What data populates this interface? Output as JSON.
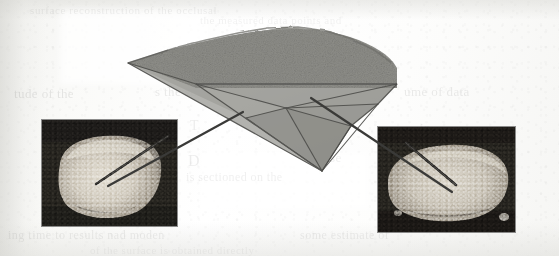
{
  "page": {
    "kind": "scanned-journal-figure",
    "width": 559,
    "height": 256,
    "background_color": "#fbfbfa",
    "paper_tint": "#f4f4f1"
  },
  "figure": {
    "name": "triangulated-3d-surface-with-photo-callouts",
    "mesh": {
      "label": "3d-surface-mesh",
      "fill_color": "#9d9d99",
      "edge_color": "#4c4c4a",
      "top_texture_color": "#8e8e8a",
      "apex_point": [
        320,
        171
      ],
      "left_tip_point": [
        128,
        63
      ],
      "facet_count": 14,
      "outline": [
        [
          128,
          63
        ],
        [
          168,
          50
        ],
        [
          230,
          36
        ],
        [
          286,
          27
        ],
        [
          330,
          31
        ],
        [
          368,
          45
        ],
        [
          393,
          62
        ],
        [
          397,
          84
        ],
        [
          378,
          104
        ],
        [
          351,
          126
        ],
        [
          322,
          171
        ],
        [
          246,
          118
        ],
        [
          196,
          84
        ]
      ],
      "edges": [
        [
          [
            128,
            63
          ],
          [
            322,
            171
          ]
        ],
        [
          [
            196,
            84
          ],
          [
            322,
            171
          ]
        ],
        [
          [
            246,
            118
          ],
          [
            322,
            171
          ]
        ],
        [
          [
            286,
            108
          ],
          [
            322,
            171
          ]
        ],
        [
          [
            351,
            126
          ],
          [
            322,
            171
          ]
        ],
        [
          [
            378,
            104
          ],
          [
            322,
            171
          ]
        ],
        [
          [
            196,
            84
          ],
          [
            286,
            108
          ]
        ],
        [
          [
            246,
            118
          ],
          [
            286,
            108
          ]
        ],
        [
          [
            286,
            108
          ],
          [
            351,
            126
          ]
        ],
        [
          [
            286,
            108
          ],
          [
            378,
            104
          ]
        ],
        [
          [
            286,
            108
          ],
          [
            397,
            84
          ]
        ],
        [
          [
            196,
            84
          ],
          [
            397,
            84
          ]
        ],
        [
          [
            128,
            63
          ],
          [
            196,
            84
          ]
        ]
      ],
      "top_ridge": [
        [
          128,
          63
        ],
        [
          150,
          56
        ],
        [
          178,
          47
        ],
        [
          206,
          40
        ],
        [
          238,
          33
        ],
        [
          268,
          28
        ],
        [
          298,
          27
        ],
        [
          326,
          31
        ],
        [
          352,
          39
        ],
        [
          374,
          50
        ],
        [
          392,
          63
        ]
      ]
    },
    "leader_lines": [
      {
        "name": "leader-line-left",
        "from_mesh_point": [
          243,
          112
        ],
        "to_inset": "photo-inset-left",
        "to_point": [
          108,
          186
        ],
        "color": "#3a3a38"
      },
      {
        "name": "leader-line-right",
        "from_mesh_point": [
          311,
          98
        ],
        "to_inset": "photo-inset-right",
        "to_point": [
          452,
          192
        ],
        "color": "#3a3a38"
      }
    ],
    "insets": [
      {
        "name": "photo-inset-left",
        "subject": "tooth-specimen-closeup-left",
        "x": 42,
        "y": 120,
        "width": 135,
        "height": 106,
        "border_color": "#2e2e2e",
        "probe_line": {
          "from": [
            126,
            16
          ],
          "to": [
            54,
            64
          ],
          "color": "#2b2a28"
        },
        "specimen_highlight_color": "#d8d3c8"
      },
      {
        "name": "photo-inset-right",
        "subject": "tooth-specimen-closeup-right",
        "x": 378,
        "y": 127,
        "width": 137,
        "height": 105,
        "border_color": "#2e2e2e",
        "probe_line": {
          "from": [
            28,
            16
          ],
          "to": [
            78,
            58
          ],
          "color": "#2b2a28"
        },
        "specimen_highlight_color": "#d4cfc4"
      }
    ]
  },
  "bleed_through_text": {
    "note": "Faint show-through text from the reverse of the scanned page; mostly illegible.",
    "color": "#2a2a2a",
    "lines": [
      {
        "name": "ghost-line-top-1",
        "text": "surface reconstruction of the occlusal",
        "x": 30,
        "y": 4,
        "size": 11,
        "opacity": 0.07,
        "letter_spacing": 0.6
      },
      {
        "name": "ghost-line-top-2",
        "text": "the measured data points and",
        "x": 200,
        "y": 14,
        "size": 11,
        "opacity": 0.06,
        "letter_spacing": 0.5
      },
      {
        "name": "ghost-line-1",
        "text": "tude of the",
        "x": 14,
        "y": 86,
        "size": 13,
        "opacity": 0.1,
        "letter_spacing": 0.4
      },
      {
        "name": "ghost-line-2",
        "text": "s the surface",
        "x": 155,
        "y": 84,
        "size": 13,
        "opacity": 0.09,
        "letter_spacing": 0.4
      },
      {
        "name": "ghost-line-3",
        "text": "ume of data",
        "x": 404,
        "y": 84,
        "size": 13,
        "opacity": 0.09,
        "letter_spacing": 0.4
      },
      {
        "name": "ghost-line-4",
        "text": "T",
        "x": 190,
        "y": 118,
        "size": 14,
        "opacity": 0.08,
        "letter_spacing": 0.4
      },
      {
        "name": "ghost-line-5",
        "text": "in",
        "x": 420,
        "y": 120,
        "size": 13,
        "opacity": 0.07,
        "letter_spacing": 0.4
      },
      {
        "name": "ghost-line-6",
        "text": "D",
        "x": 188,
        "y": 152,
        "size": 16,
        "opacity": 0.08,
        "letter_spacing": 0.4
      },
      {
        "name": "ghost-line-7",
        "text": "se",
        "x": 330,
        "y": 150,
        "size": 13,
        "opacity": 0.07,
        "letter_spacing": 0.4
      },
      {
        "name": "ghost-line-8",
        "text": "is sectioned on the",
        "x": 186,
        "y": 170,
        "size": 12,
        "opacity": 0.07,
        "letter_spacing": 0.4
      },
      {
        "name": "ghost-line-9",
        "text": "ing time to results nad moden",
        "x": 8,
        "y": 228,
        "size": 12,
        "opacity": 0.08,
        "letter_spacing": 0.5
      },
      {
        "name": "ghost-line-10",
        "text": "some estimate of",
        "x": 300,
        "y": 228,
        "size": 12,
        "opacity": 0.08,
        "letter_spacing": 0.5
      },
      {
        "name": "ghost-line-11",
        "text": "of the surface is obtained directly",
        "x": 90,
        "y": 244,
        "size": 11,
        "opacity": 0.05,
        "letter_spacing": 0.5
      }
    ]
  }
}
